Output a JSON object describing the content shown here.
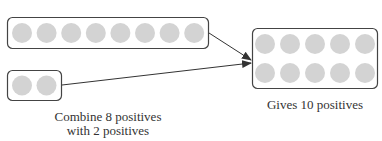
{
  "diagram": {
    "groups": [
      {
        "id": "group-8",
        "count": 8
      },
      {
        "id": "group-2",
        "count": 2
      },
      {
        "id": "result-10",
        "count": 10
      }
    ],
    "labels": {
      "combine_line1": "Combine 8 positives",
      "combine_line2": "with 2 positives",
      "result": "Gives 10 positives"
    },
    "colors": {
      "counter": "#d3d3d3",
      "border": "#444444",
      "arrow": "#333333"
    }
  }
}
